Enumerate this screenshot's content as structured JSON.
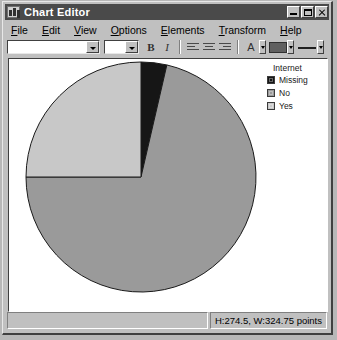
{
  "window": {
    "title": "Chart Editor",
    "icon": "chart-editor-icon",
    "controls": {
      "minimize": "_",
      "maximize": "□",
      "close": "✕"
    }
  },
  "menubar": {
    "items": [
      {
        "label": "File",
        "accel": "F"
      },
      {
        "label": "Edit",
        "accel": "E"
      },
      {
        "label": "View",
        "accel": "V"
      },
      {
        "label": "Options",
        "accel": "O"
      },
      {
        "label": "Elements",
        "accel": "E"
      },
      {
        "label": "Transform",
        "accel": "T"
      },
      {
        "label": "Help",
        "accel": "H"
      }
    ]
  },
  "toolbar": {
    "font_family_value": "",
    "font_size_value": "",
    "bold_label": "B",
    "italic_label": "I",
    "align_left": "align-left",
    "align_center": "align-center",
    "align_right": "align-right",
    "text_color_label": "A",
    "fill_color": "#606060",
    "line_style": "line-weight"
  },
  "legend": {
    "title": "Internet",
    "entries": [
      {
        "label": "Missing",
        "color": "#161616"
      },
      {
        "label": "No",
        "color": "#9a9a9a"
      },
      {
        "label": "Yes",
        "color": "#c8c8c8"
      }
    ]
  },
  "statusbar": {
    "dimensions": "H:274.5, W:324.75 points"
  },
  "chart_data": {
    "type": "pie",
    "title": "",
    "legend_title": "Internet",
    "legend_position": "top-right",
    "categories": [
      "Missing",
      "No",
      "Yes"
    ],
    "values": [
      3.6,
      71.4,
      25.0
    ],
    "unit": "percent",
    "start_angle_deg": 0,
    "direction": "clockwise",
    "slice_angles_deg": [
      13,
      257,
      90
    ],
    "colors": [
      "#161616",
      "#9a9a9a",
      "#c8c8c8"
    ],
    "stroke": "#1a1a1a",
    "center": {
      "cx": 132,
      "cy": 118
    },
    "radius": 115,
    "grid": false
  }
}
